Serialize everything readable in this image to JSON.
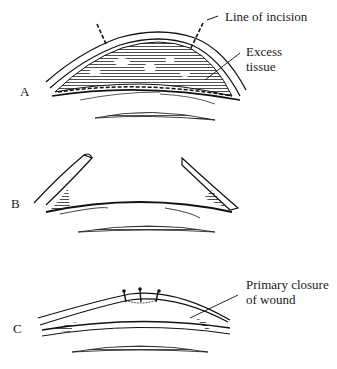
{
  "panels": [
    {
      "id": "A",
      "label": "A"
    },
    {
      "id": "B",
      "label": "B"
    },
    {
      "id": "C",
      "label": "C"
    }
  ],
  "annotations": {
    "line_of_incision": "Line of incision",
    "excess_tissue_1": "Excess",
    "excess_tissue_2": "tissue",
    "primary_closure_1": "Primary closure",
    "primary_closure_2": "of wound"
  },
  "colors": {
    "ink": "#111111",
    "background": "#ffffff"
  }
}
